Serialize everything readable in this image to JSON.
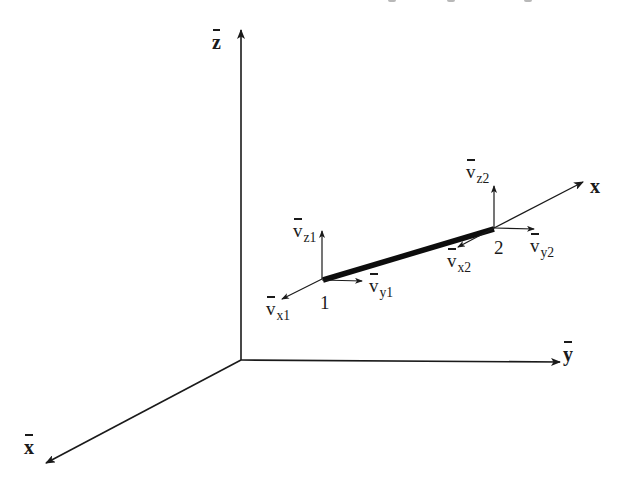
{
  "diagram": {
    "type": "3d-beam-element-coordinate-systems",
    "colors": {
      "stroke": "#1a1a1a",
      "element": "#0d0d0d",
      "background": "#ffffff"
    },
    "global_axes": {
      "origin": [
        241,
        360
      ],
      "z_bar": {
        "label": "z",
        "end": [
          241,
          28
        ]
      },
      "y_bar": {
        "label": "y",
        "end": [
          562,
          362
        ]
      },
      "x_bar": {
        "label": "x",
        "end": [
          44,
          464
        ]
      }
    },
    "local_axis": {
      "label": "x",
      "start": [
        282,
        298
      ],
      "end": [
        585,
        181
      ]
    },
    "element": {
      "node_1": [
        322,
        279
      ],
      "node_2": [
        494,
        228
      ]
    },
    "nodes": [
      {
        "id": "1",
        "label": "1"
      },
      {
        "id": "2",
        "label": "2"
      }
    ],
    "vectors": [
      {
        "id": "vx1",
        "label": "v",
        "sub": "x1"
      },
      {
        "id": "vy1",
        "label": "v",
        "sub": "y1"
      },
      {
        "id": "vz1",
        "label": "v",
        "sub": "z1"
      },
      {
        "id": "vx2",
        "label": "v",
        "sub": "x2"
      },
      {
        "id": "vy2",
        "label": "v",
        "sub": "y2"
      },
      {
        "id": "vz2",
        "label": "v",
        "sub": "z2"
      }
    ]
  }
}
